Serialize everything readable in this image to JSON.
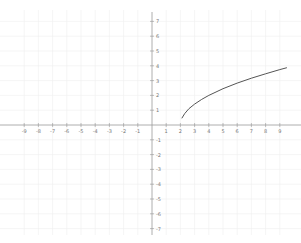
{
  "chart_data": {
    "type": "line",
    "title": "",
    "xlabel": "",
    "ylabel": "",
    "grid": true,
    "xlim": [
      -10,
      10
    ],
    "ylim": [
      -7.5,
      7.5
    ],
    "x_ticks": [
      -9,
      -8,
      -7,
      -6,
      -5,
      -4,
      -3,
      -2,
      -1,
      1,
      2,
      3,
      4,
      5,
      6,
      7,
      8,
      9
    ],
    "y_ticks": [
      -7,
      -6,
      -5,
      -4,
      -3,
      -2,
      -1,
      1,
      2,
      3,
      4,
      5,
      6,
      7
    ],
    "series": [
      {
        "name": "curve",
        "color": "#555555",
        "x": [
          2.1,
          2.3,
          2.6,
          3,
          3.5,
          4,
          5,
          6,
          7,
          8,
          9,
          9.5
        ],
        "y": [
          0.45,
          0.77,
          1.1,
          1.41,
          1.73,
          2.0,
          2.45,
          2.83,
          3.16,
          3.46,
          3.74,
          3.87
        ]
      }
    ]
  },
  "colors": {
    "background": "#ffffff",
    "grid": "#eeeeee",
    "axis": "#999999",
    "curve": "#555555",
    "tick_label": "#777777"
  }
}
